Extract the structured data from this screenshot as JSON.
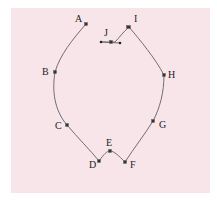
{
  "diagram": {
    "type": "labeled-curve-outline",
    "background_color": "#f8e5ea",
    "line_color": "#6e6e6e",
    "points": [
      {
        "label": "A",
        "x": 86,
        "y": 24
      },
      {
        "label": "B",
        "x": 55,
        "y": 72
      },
      {
        "label": "C",
        "x": 67,
        "y": 125
      },
      {
        "label": "D",
        "x": 99,
        "y": 161
      },
      {
        "label": "E",
        "x": 110,
        "y": 151
      },
      {
        "label": "F",
        "x": 125,
        "y": 162
      },
      {
        "label": "G",
        "x": 153,
        "y": 121
      },
      {
        "label": "H",
        "x": 164,
        "y": 75
      },
      {
        "label": "I",
        "x": 129,
        "y": 27
      },
      {
        "label": "J",
        "x": 111,
        "y": 42
      }
    ],
    "labels": {
      "A": "A",
      "B": "B",
      "C": "C",
      "D": "D",
      "E": "E",
      "F": "F",
      "G": "G",
      "H": "H",
      "I": "I",
      "J": "J"
    }
  }
}
